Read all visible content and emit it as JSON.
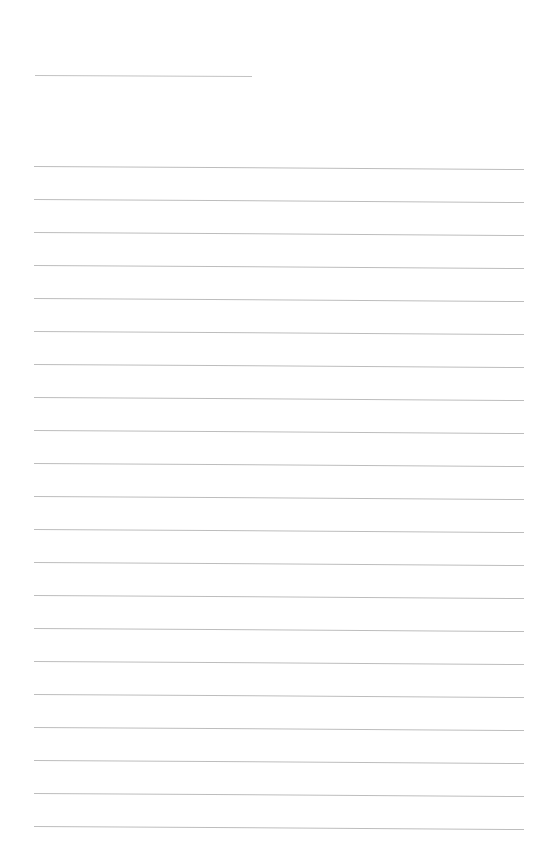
{
  "page": {
    "type": "blank lined paper",
    "background_color": "#ffffff",
    "line_color": "#bdbdbd"
  },
  "title_line": {
    "x_start": 35,
    "x_end": 252,
    "y": 75,
    "text": ""
  },
  "ruled_lines": {
    "count": 21,
    "x_start": 34,
    "x_end": 524,
    "first_y": 166,
    "spacing": 33,
    "entries": [
      "",
      "",
      "",
      "",
      "",
      "",
      "",
      "",
      "",
      "",
      "",
      "",
      "",
      "",
      "",
      "",
      "",
      "",
      "",
      "",
      ""
    ]
  }
}
